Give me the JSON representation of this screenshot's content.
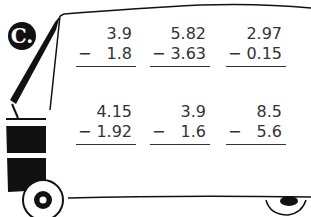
{
  "section_label": "C.",
  "problems": [
    {
      "top": "3.9",
      "bottom": "1.8",
      "operator": "−"
    },
    {
      "top": "5.82",
      "bottom": "3.63",
      "operator": "−"
    },
    {
      "top": "2.97",
      "bottom": "0.15",
      "operator": "−"
    },
    {
      "top": "4.15",
      "bottom": "1.92",
      "operator": "−"
    },
    {
      "top": "3.9",
      "bottom": "1.6",
      "operator": "−"
    },
    {
      "top": "8.5",
      "bottom": "5.6",
      "operator": "−"
    }
  ]
}
